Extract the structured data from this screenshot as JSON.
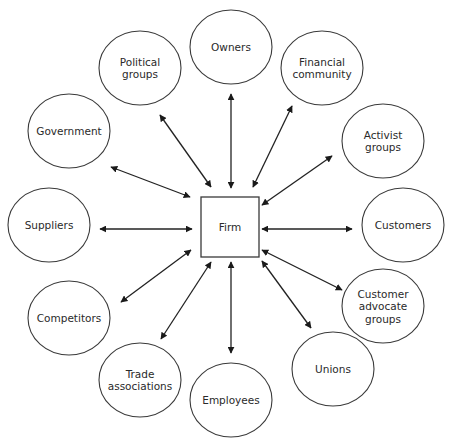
{
  "diagram": {
    "type": "stakeholder-hub",
    "center": {
      "id": "firm",
      "label": "Firm",
      "x": 201,
      "y": 197,
      "width": 58,
      "height": 60
    },
    "nodes": [
      {
        "id": "owners",
        "lines": [
          "Owners"
        ],
        "cx": 231,
        "cy": 47,
        "rx": 41,
        "ry": 37
      },
      {
        "id": "financial-community",
        "lines": [
          "Financial",
          "community"
        ],
        "cx": 322,
        "cy": 68,
        "rx": 41,
        "ry": 37
      },
      {
        "id": "activist-groups",
        "lines": [
          "Activist",
          "groups"
        ],
        "cx": 383,
        "cy": 141,
        "rx": 41,
        "ry": 37
      },
      {
        "id": "customers",
        "lines": [
          "Customers"
        ],
        "cx": 403,
        "cy": 225,
        "rx": 41,
        "ry": 37
      },
      {
        "id": "customer-advocate-groups",
        "lines": [
          "Customer",
          "advocate",
          "groups"
        ],
        "cx": 383,
        "cy": 306,
        "rx": 41,
        "ry": 37
      },
      {
        "id": "unions",
        "lines": [
          "Unions"
        ],
        "cx": 333,
        "cy": 369,
        "rx": 41,
        "ry": 37
      },
      {
        "id": "employees",
        "lines": [
          "Employees"
        ],
        "cx": 231,
        "cy": 400,
        "rx": 41,
        "ry": 37
      },
      {
        "id": "trade-associations",
        "lines": [
          "Trade",
          "associations"
        ],
        "cx": 140,
        "cy": 380,
        "rx": 41,
        "ry": 37
      },
      {
        "id": "competitors",
        "lines": [
          "Competitors"
        ],
        "cx": 69,
        "cy": 318,
        "rx": 41,
        "ry": 37
      },
      {
        "id": "suppliers",
        "lines": [
          "Suppliers"
        ],
        "cx": 49,
        "cy": 225,
        "rx": 41,
        "ry": 37
      },
      {
        "id": "government",
        "lines": [
          "Government"
        ],
        "cx": 69,
        "cy": 131,
        "rx": 41,
        "ry": 37
      },
      {
        "id": "political-groups",
        "lines": [
          "Political",
          "groups"
        ],
        "cx": 140,
        "cy": 68,
        "rx": 41,
        "ry": 37
      }
    ],
    "edges": [
      {
        "to": "owners",
        "x1": 231,
        "y1": 94,
        "x2": 231,
        "y2": 188,
        "bidirectional": true
      },
      {
        "to": "financial-community",
        "x1": 292,
        "y1": 106,
        "x2": 253,
        "y2": 187,
        "bidirectional": true
      },
      {
        "to": "activist-groups",
        "x1": 332,
        "y1": 156,
        "x2": 262,
        "y2": 205,
        "bidirectional": true
      },
      {
        "to": "customers",
        "x1": 352,
        "y1": 229,
        "x2": 262,
        "y2": 229,
        "bidirectional": true
      },
      {
        "to": "customer-advocate-groups",
        "x1": 342,
        "y1": 290,
        "x2": 262,
        "y2": 250,
        "bidirectional": true
      },
      {
        "to": "unions",
        "x1": 311,
        "y1": 328,
        "x2": 262,
        "y2": 261,
        "bidirectional": true
      },
      {
        "to": "employees",
        "x1": 231,
        "y1": 353,
        "x2": 231,
        "y2": 262,
        "bidirectional": true
      },
      {
        "to": "trade-associations",
        "x1": 161,
        "y1": 339,
        "x2": 211,
        "y2": 262,
        "bidirectional": true
      },
      {
        "to": "competitors",
        "x1": 121,
        "y1": 302,
        "x2": 191,
        "y2": 250,
        "bidirectional": true
      },
      {
        "to": "suppliers",
        "x1": 100,
        "y1": 229,
        "x2": 192,
        "y2": 229,
        "bidirectional": true
      },
      {
        "to": "government",
        "x1": 111,
        "y1": 167,
        "x2": 190,
        "y2": 197,
        "bidirectional": true
      },
      {
        "to": "political-groups",
        "x1": 160,
        "y1": 115,
        "x2": 211,
        "y2": 187,
        "bidirectional": true
      }
    ],
    "colors": {
      "stroke": "#3a3a3a",
      "arrow": "#222222",
      "text": "#2a2a2a",
      "background": "#ffffff"
    }
  }
}
